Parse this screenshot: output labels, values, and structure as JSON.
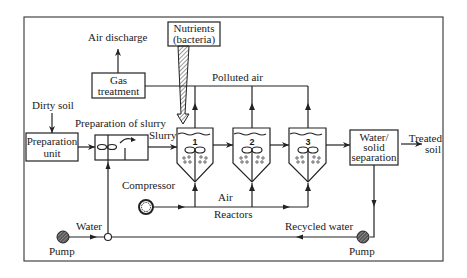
{
  "diagram": {
    "labels": {
      "air_discharge": "Air discharge",
      "gas_treatment_line1": "Gas",
      "gas_treatment_line2": "treatment",
      "nutrients_line1": "Nutrients",
      "nutrients_line2": "(bacteria)",
      "polluted_air": "Polluted air",
      "dirty_soil": "Dirty soil",
      "preparation_unit_line1": "Preparation",
      "preparation_unit_line2": "unit",
      "preparation_of_slurry": "Preparation of slurry",
      "slurry": "Slurry",
      "separation_line1": "Water/",
      "separation_line2": "solid",
      "separation_line3": "separation",
      "treated_soil_line1": "Treated",
      "treated_soil_line2": "soil",
      "compressor": "Compressor",
      "air": "Air",
      "reactors": "Reactors",
      "water": "Water",
      "pump_left": "Pump",
      "recycled_water": "Recycled water",
      "pump_right": "Pump"
    },
    "reactors": [
      {
        "number": "1"
      },
      {
        "number": "2"
      },
      {
        "number": "3"
      }
    ]
  }
}
